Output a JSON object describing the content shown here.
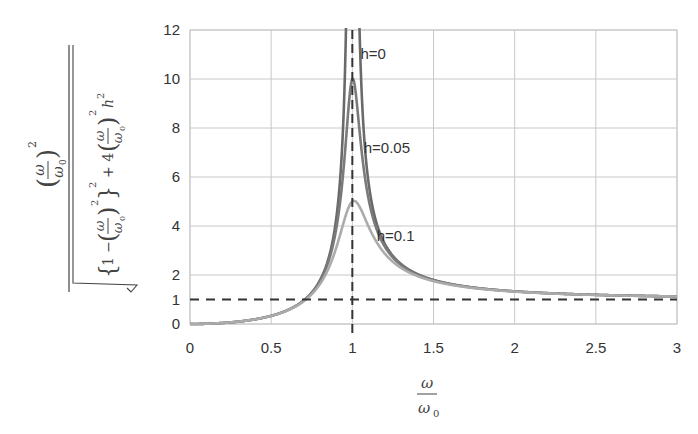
{
  "chart_data": {
    "type": "line",
    "title": "",
    "xlabel": "ω / ω0",
    "ylabel": "(ω/ω0)^2 / sqrt({1-(ω/ω0)^2}^2 + 4(ω/ω0)^2 h^2)",
    "xlim": [
      0,
      3
    ],
    "ylim": [
      0,
      12
    ],
    "x_ticks": [
      "0",
      "0.5",
      "1",
      "1.5",
      "2",
      "2.5",
      "3"
    ],
    "y_ticks": [
      "0",
      "1",
      "2",
      "4",
      "6",
      "8",
      "10",
      "12"
    ],
    "grid": true,
    "series": [
      {
        "name": "h=0",
        "h": 0,
        "color": "#6a6a6a",
        "peak": "unbounded at x=1",
        "x": [
          0,
          0.5,
          0.8,
          0.9,
          0.95,
          1.05,
          1.1,
          1.2,
          1.5,
          2,
          2.5,
          3
        ],
        "values": [
          0,
          0.33,
          1.78,
          4.26,
          9.26,
          10.76,
          5.76,
          3.27,
          1.8,
          1.33,
          1.19,
          1.125
        ]
      },
      {
        "name": "h=0.05",
        "h": 0.05,
        "color": "#7a7a7a",
        "peak": 10,
        "x": [
          0,
          0.5,
          0.8,
          0.9,
          0.95,
          1,
          1.05,
          1.1,
          1.2,
          1.5,
          2,
          2.5,
          3
        ],
        "values": [
          0,
          0.33,
          1.76,
          4.0,
          6.6,
          10.0,
          7.4,
          5.0,
          3.15,
          1.79,
          1.33,
          1.19,
          1.125
        ]
      },
      {
        "name": "h=0.1",
        "h": 0.1,
        "color": "#ababab",
        "peak": 5,
        "x": [
          0,
          0.5,
          0.8,
          0.9,
          0.95,
          1,
          1.05,
          1.1,
          1.2,
          1.5,
          2,
          2.5,
          3
        ],
        "values": [
          0,
          0.33,
          1.66,
          3.29,
          4.36,
          5.0,
          4.52,
          3.73,
          2.74,
          1.76,
          1.32,
          1.19,
          1.125
        ]
      }
    ],
    "reference_lines": [
      {
        "type": "horizontal",
        "y": 1,
        "style": "dashed",
        "color": "#333333"
      },
      {
        "type": "vertical",
        "x": 1,
        "style": "dashed",
        "color": "#333333"
      }
    ],
    "annotations": [
      {
        "text": "h=0",
        "x": 1.05,
        "y": 10.8
      },
      {
        "text": "h=0.05",
        "x": 1.07,
        "y": 7.0
      },
      {
        "text": "h=0.1",
        "x": 1.15,
        "y": 3.4
      }
    ],
    "legend": "none (inline annotations)"
  }
}
